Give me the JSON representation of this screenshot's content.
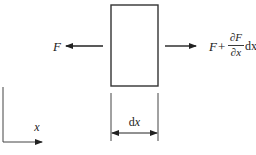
{
  "diagram": {
    "type": "free-body-element",
    "colors": {
      "stroke": "#333333",
      "text": "#222222",
      "background": "#ffffff"
    },
    "element": {
      "label": "element dx"
    },
    "left_force": {
      "label": "F",
      "direction": "left"
    },
    "right_force": {
      "label_prefix": "F",
      "plus": "+",
      "numerator": "∂F",
      "denominator": "∂x",
      "suffix": "dx",
      "direction": "right",
      "full_text": "F + (∂F/∂x) dx"
    },
    "dimension": {
      "label_d": "d",
      "label_x": "x",
      "full_text": "dx"
    },
    "axis": {
      "label": "x"
    }
  }
}
